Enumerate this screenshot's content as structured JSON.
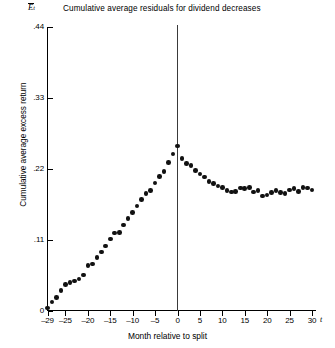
{
  "chart_data": {
    "type": "scatter",
    "title": "Cumulative average residuals for dividend decreases",
    "xlabel": "Month relative to split",
    "ylabel": "Cumulative average excess return",
    "y_axis_symbol": "E",
    "y_axis_symbol_sub": "t",
    "x_axis_symbol": "t",
    "xlim": [
      -29,
      30
    ],
    "ylim": [
      0,
      0.44
    ],
    "grid": false,
    "legend": "none",
    "annotations": [
      {
        "type": "vertical-line",
        "x": 0,
        "label": "split month"
      }
    ],
    "yticks": [
      0,
      0.11,
      0.22,
      0.33,
      0.44
    ],
    "ytick_labels": [
      "0",
      ".11",
      ".22",
      ".33",
      ".44"
    ],
    "xticks": [
      -29,
      -25,
      -20,
      -15,
      -10,
      -5,
      0,
      5,
      10,
      15,
      20,
      25,
      30
    ],
    "xtick_labels": [
      "–29",
      "–25",
      "–20",
      "–15",
      "–10",
      "–5",
      "0",
      "5",
      "10",
      "15",
      "20",
      "25",
      "30"
    ],
    "x": [
      -29,
      -28,
      -27,
      -26,
      -25,
      -24,
      -23,
      -22,
      -21,
      -20,
      -19,
      -18,
      -17,
      -16,
      -15,
      -14,
      -13,
      -12,
      -11,
      -10,
      -9,
      -8,
      -7,
      -6,
      -5,
      -4,
      -3,
      -2,
      -1,
      0,
      1,
      2,
      3,
      4,
      5,
      6,
      7,
      8,
      9,
      10,
      11,
      12,
      13,
      14,
      15,
      16,
      17,
      18,
      19,
      20,
      21,
      22,
      23,
      24,
      25,
      26,
      27,
      28,
      29,
      30
    ],
    "values": [
      0.004,
      0.013,
      0.02,
      0.031,
      0.04,
      0.043,
      0.046,
      0.049,
      0.055,
      0.07,
      0.072,
      0.082,
      0.091,
      0.1,
      0.111,
      0.12,
      0.121,
      0.133,
      0.143,
      0.152,
      0.162,
      0.172,
      0.182,
      0.186,
      0.198,
      0.208,
      0.216,
      0.23,
      0.243,
      0.255,
      0.236,
      0.228,
      0.225,
      0.217,
      0.212,
      0.207,
      0.2,
      0.197,
      0.193,
      0.191,
      0.186,
      0.184,
      0.185,
      0.19,
      0.189,
      0.191,
      0.184,
      0.186,
      0.178,
      0.179,
      0.183,
      0.186,
      0.183,
      0.182,
      0.187,
      0.189,
      0.185,
      0.191,
      0.19,
      0.187
    ]
  }
}
